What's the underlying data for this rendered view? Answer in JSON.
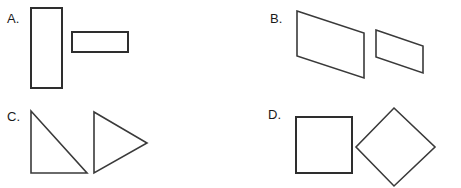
{
  "worksheet": {
    "background_color": "#ffffff",
    "stroke_color": "#2e2e2e",
    "width": 461,
    "height": 188,
    "choices": [
      {
        "id": "A",
        "label": "A.",
        "shapes": [
          {
            "name": "tall-vertical-rectangle",
            "type": "rectangle",
            "x": 31,
            "y": 8,
            "width": 31,
            "height": 80
          },
          {
            "name": "wide-horizontal-rectangle",
            "type": "rectangle",
            "x": 72,
            "y": 32,
            "width": 56,
            "height": 20
          }
        ]
      },
      {
        "id": "B",
        "label": "B.",
        "shapes": [
          {
            "name": "large-parallelogram",
            "type": "parallelogram",
            "points": "66,11 133,33 133,78 66,56"
          },
          {
            "name": "small-parallelogram",
            "type": "parallelogram",
            "points": "145,30 192,46 192,73 145,57"
          }
        ]
      },
      {
        "id": "C",
        "label": "C.",
        "shapes": [
          {
            "name": "right-triangle",
            "type": "triangle",
            "points": "31,17 31,79 87,79"
          },
          {
            "name": "right-pointing-triangle",
            "type": "triangle",
            "points": "94,18 147,49 94,79"
          }
        ]
      },
      {
        "id": "D",
        "label": "D.",
        "shapes": [
          {
            "name": "square",
            "type": "square",
            "x": 65,
            "y": 23,
            "width": 56,
            "height": 56
          },
          {
            "name": "diamond",
            "type": "diamond",
            "points": "163,14 204,53 163,92 125,53"
          }
        ]
      }
    ]
  }
}
